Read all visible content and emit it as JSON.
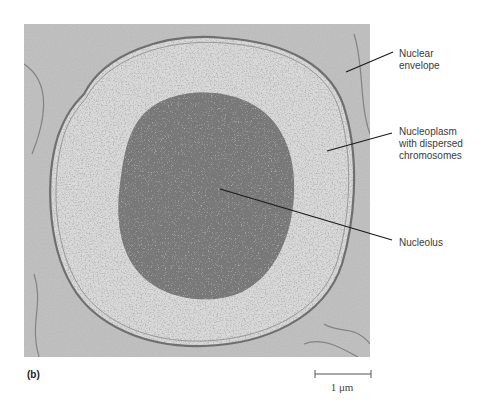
{
  "figure": {
    "panel_label": "(b)",
    "labels": [
      {
        "id": "nuclear-envelope",
        "text": "Nuclear\nenvelope",
        "lines": [
          "Nuclear",
          "envelope"
        ]
      },
      {
        "id": "nucleoplasm",
        "text": "Nucleoplasm with dispersed chromosomes",
        "lines": [
          "Nucleoplasm",
          "with dispersed",
          "chromosomes"
        ]
      },
      {
        "id": "nucleolus",
        "text": "Nucleolus",
        "lines": [
          "Nucleolus"
        ]
      }
    ],
    "scale_bar": {
      "label": "1 μm"
    },
    "colors": {
      "background": "#ffffff",
      "cytoplasm": "#b8b8b8",
      "nucleoplasm": "#d6d6d6",
      "nucleolus": "#6e6e6e",
      "envelope": "#7a7a7a",
      "text": "#3a3a3a",
      "leader": "#1a1a1a"
    }
  }
}
